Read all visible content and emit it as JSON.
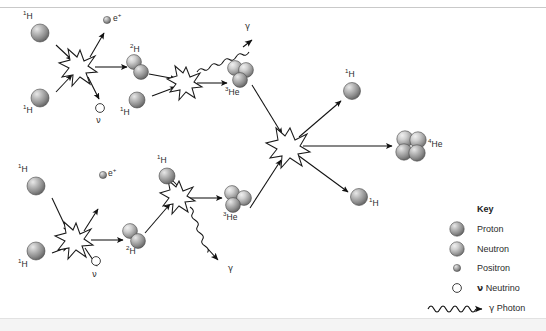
{
  "figure": {
    "background": "#ffffff",
    "border_color": "#c9c9c9"
  },
  "labels": {
    "hydrogen_1": "1H",
    "hydrogen_2": "2H",
    "helium_3": "3He",
    "helium_4": "4He",
    "positron": "e+",
    "neutrino": "v",
    "photon": "y"
  },
  "nodes": [
    {
      "id": "h1-a",
      "label": "1H",
      "type": "proton",
      "x": 40,
      "y": 33
    },
    {
      "id": "h1-b",
      "label": "1H",
      "type": "proton",
      "x": 40,
      "y": 98
    },
    {
      "id": "pos-a",
      "label": "e+",
      "type": "positron",
      "x": 107,
      "y": 20
    },
    {
      "id": "neu-a",
      "label": "v",
      "type": "neutrino",
      "x": 100,
      "y": 108
    },
    {
      "id": "d2-a",
      "label": "2H",
      "type": "deuteron",
      "x": 137,
      "y": 65
    },
    {
      "id": "h1-c",
      "label": "1H",
      "type": "proton",
      "x": 137,
      "y": 100
    },
    {
      "id": "he3-a",
      "label": "3He",
      "type": "helium3",
      "x": 239,
      "y": 73
    },
    {
      "id": "gam-a",
      "label": "y",
      "type": "photon",
      "x": 241,
      "y": 29
    },
    {
      "id": "h1-d",
      "label": "1H",
      "type": "proton",
      "x": 167,
      "y": 176
    },
    {
      "id": "h1-e",
      "label": "1H",
      "type": "proton",
      "x": 36,
      "y": 186
    },
    {
      "id": "h1-f",
      "label": "1H",
      "type": "proton",
      "x": 36,
      "y": 251
    },
    {
      "id": "pos-b",
      "label": "e+",
      "type": "positron",
      "x": 103,
      "y": 175
    },
    {
      "id": "neu-b",
      "label": "v",
      "type": "neutrino",
      "x": 96,
      "y": 261
    },
    {
      "id": "d2-b",
      "label": "2H",
      "type": "deuteron",
      "x": 133,
      "y": 234
    },
    {
      "id": "he3-b",
      "label": "3He",
      "type": "helium3",
      "x": 236,
      "y": 199
    },
    {
      "id": "gam-b",
      "label": "y",
      "type": "photon",
      "x": 231,
      "y": 268
    },
    {
      "id": "h1-g",
      "label": "1H",
      "type": "proton",
      "x": 352,
      "y": 91
    },
    {
      "id": "h1-h",
      "label": "1H",
      "type": "proton",
      "x": 359,
      "y": 197
    },
    {
      "id": "he4",
      "label": "4He",
      "type": "helium4",
      "x": 411,
      "y": 146
    }
  ],
  "reactions": [
    {
      "id": "burst-upper-1",
      "x": 80,
      "y": 66
    },
    {
      "id": "burst-upper-2",
      "x": 186,
      "y": 82
    },
    {
      "id": "burst-lower-1",
      "x": 76,
      "y": 239
    },
    {
      "id": "burst-lower-2",
      "x": 179,
      "y": 196
    },
    {
      "id": "burst-center",
      "x": 290,
      "y": 146
    }
  ],
  "key": {
    "title": "Key",
    "items": [
      {
        "icon": "proton-sphere",
        "label": "Proton",
        "prefix": ""
      },
      {
        "icon": "neutron-sphere",
        "label": "Neutron",
        "prefix": ""
      },
      {
        "icon": "positron-dot",
        "label": "Positron",
        "prefix": ""
      },
      {
        "icon": "neutrino-circle",
        "label": "Neutrino",
        "prefix": "v"
      },
      {
        "icon": "photon-wave",
        "label": "Photon",
        "prefix": "y"
      }
    ]
  },
  "colors": {
    "sphere_dark": "#6f6f6f",
    "sphere_light": "#d8d8d8",
    "stroke": "#1a1a1a",
    "text": "#2b2b2b"
  }
}
